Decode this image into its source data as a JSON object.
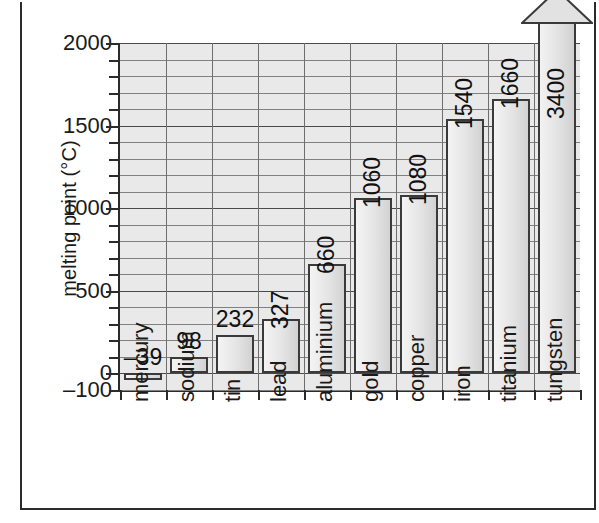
{
  "chart_data": {
    "type": "bar",
    "title": "",
    "xlabel": "",
    "ylabel": "melting point (°C)",
    "categories": [
      "mercury",
      "sodium",
      "tin",
      "lead",
      "aluminium",
      "gold",
      "copper",
      "iron",
      "titanium",
      "tungsten"
    ],
    "values": [
      -39,
      98,
      232,
      327,
      660,
      1060,
      1080,
      1540,
      1660,
      3400
    ],
    "value_labels": [
      "–39",
      "98",
      "232",
      "327",
      "660",
      "1060",
      "1080",
      "1540",
      "1660",
      "3400"
    ],
    "ylim": [
      -100,
      2000
    ],
    "ytick_labels": [
      "2000",
      "1500",
      "1000",
      "500",
      "0",
      "–100"
    ],
    "ytick_values": [
      2000,
      1500,
      1000,
      500,
      0,
      -100
    ],
    "minor_tick_step": 100,
    "grid": true,
    "legend": "none"
  },
  "figure": {
    "background_color": "#ffffff",
    "plot_background_color": "#e9e9e9",
    "axis_color": "#2b2b2b",
    "bar_outline_color": "#3a3a3a",
    "gridline_color": "#808080"
  }
}
